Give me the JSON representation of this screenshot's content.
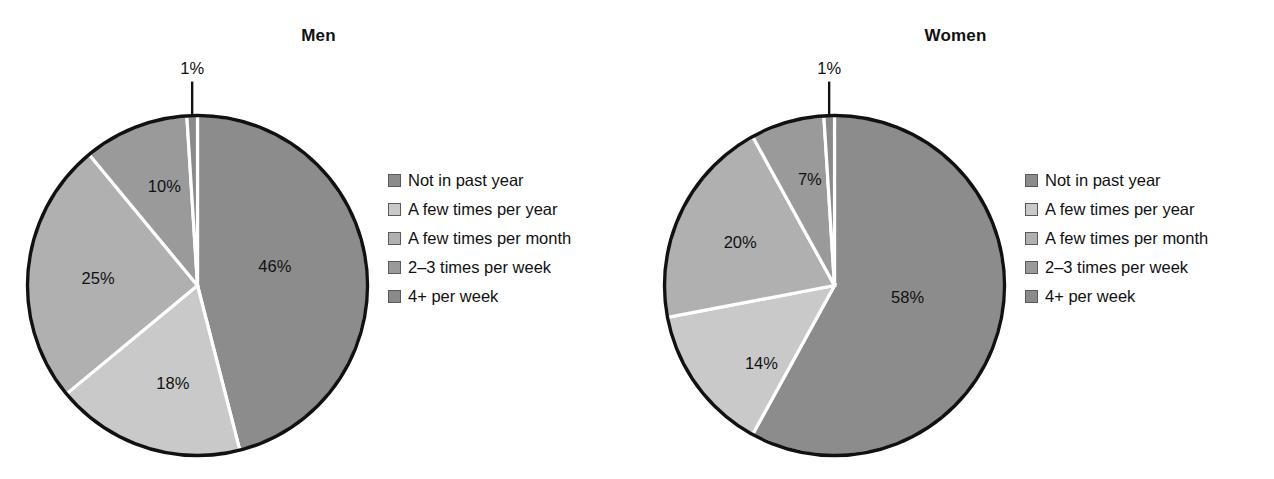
{
  "chart_data": {
    "type": "pie",
    "title": "",
    "legend_position": "right",
    "categories": [
      "Not in past year",
      "A few times per year",
      "A few times per month",
      "2–3 times per week",
      "4+ per week"
    ],
    "colors": [
      "#8c8c8c",
      "#c9c9c9",
      "#b0b0b0",
      "#9a9a9a",
      "#8a8a8a"
    ],
    "series": [
      {
        "name": "Men",
        "values": [
          46,
          18,
          25,
          10,
          1
        ],
        "labels": [
          "46%",
          "18%",
          "25%",
          "10%",
          "1%"
        ]
      },
      {
        "name": "Women",
        "values": [
          58,
          14,
          20,
          7,
          1
        ],
        "labels": [
          "58%",
          "14%",
          "20%",
          "7%",
          "1%"
        ]
      }
    ]
  },
  "panels": [
    {
      "title": "Men",
      "slices": [
        {
          "label": "46%",
          "value": 46,
          "color": "#8c8c8c",
          "lx": 0.455,
          "ly": 0.115
        },
        {
          "label": "18%",
          "value": 18,
          "color": "#c9c9c9",
          "lx": -0.145,
          "ly": -0.575
        },
        {
          "label": "25%",
          "value": 25,
          "color": "#b0b0b0",
          "lx": -0.585,
          "ly": 0.045
        },
        {
          "label": "10%",
          "value": 10,
          "color": "#9a9a9a",
          "lx": -0.195,
          "ly": 0.585
        },
        {
          "label": "1%",
          "value": 1,
          "color": "#8a8a8a",
          "callout": true
        }
      ],
      "legend": {
        "items": [
          {
            "label": "Not in past year",
            "color": "#8c8c8c"
          },
          {
            "label": "A few times per year",
            "color": "#c9c9c9"
          },
          {
            "label": "A few times per month",
            "color": "#b0b0b0"
          },
          {
            "label": "2–3 times per week",
            "color": "#9a9a9a"
          },
          {
            "label": "4+ per week",
            "color": "#8a8a8a"
          }
        ]
      }
    },
    {
      "title": "Women",
      "slices": [
        {
          "label": "58%",
          "value": 58,
          "color": "#8c8c8c",
          "lx": 0.43,
          "ly": -0.065
        },
        {
          "label": "14%",
          "value": 14,
          "color": "#c9c9c9",
          "lx": -0.43,
          "ly": -0.455
        },
        {
          "label": "20%",
          "value": 20,
          "color": "#b0b0b0",
          "lx": -0.555,
          "ly": 0.255
        },
        {
          "label": "7%",
          "value": 7,
          "color": "#9a9a9a",
          "lx": -0.145,
          "ly": 0.625
        },
        {
          "label": "1%",
          "value": 1,
          "color": "#8a8a8a",
          "callout": true
        }
      ],
      "legend": {
        "items": [
          {
            "label": "Not in past year",
            "color": "#8c8c8c"
          },
          {
            "label": "A few times per year",
            "color": "#c9c9c9"
          },
          {
            "label": "A few times per month",
            "color": "#b0b0b0"
          },
          {
            "label": "2–3 times per week",
            "color": "#9a9a9a"
          },
          {
            "label": "4+ per week",
            "color": "#8a8a8a"
          }
        ]
      }
    }
  ]
}
